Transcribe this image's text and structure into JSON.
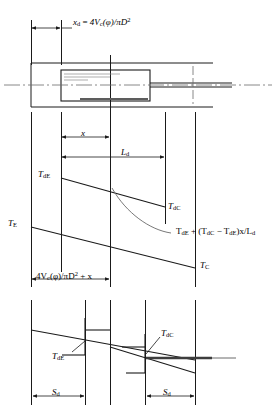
{
  "figure": {
    "type": "engineering-schematic",
    "width": 277,
    "height": 418,
    "line_color": "#1a1a1a",
    "background": "#ffffff"
  },
  "panels": {
    "top": {
      "name": "cylinder-piston-cross-section",
      "dimension_label": {
        "symbol": "x",
        "subscript": "d",
        "equals": "=",
        "expression_prefix": "4V",
        "expression_sub": "c",
        "expression_arg": "(φ)/πD",
        "expression_sup": "2",
        "full_text": "x_d = 4V_c(φ)/πD²"
      }
    },
    "middle": {
      "name": "temperature-profile-panel",
      "dimensions": [
        {
          "id": "x-dimension",
          "label": "x",
          "sub": ""
        },
        {
          "id": "ld-dimension",
          "label": "L",
          "sub": "d"
        }
      ],
      "labels": [
        {
          "id": "t-de-label",
          "base": "T",
          "sub": "dE"
        },
        {
          "id": "t-dc-label",
          "base": "T",
          "sub": "dC"
        },
        {
          "id": "t-e-label",
          "base": "T",
          "sub": "E"
        },
        {
          "id": "t-c-label",
          "base": "T",
          "sub": "C"
        }
      ],
      "equation": {
        "id": "interpolation-equation",
        "full_text": "T_dE + (T_dC − T_dE)x/L_d",
        "parts": {
          "term1_base": "T",
          "term1_sub": "dE",
          "plus": " + (",
          "term2_base": "T",
          "term2_sub": "dC",
          "minus": " − ",
          "term3_base": "T",
          "term3_sub": "dE",
          "tail_open": ")",
          "tail_x": "x",
          "tail_div": "/",
          "tail_L": "L",
          "tail_Lsub": "d"
        }
      },
      "bottom_dimension": {
        "id": "dead-space-plus-x-dimension",
        "prefix": "4V",
        "sub": "c",
        "mid": "(φ)/πD",
        "sup": "2",
        "tail": " + x",
        "full_text": "4V_c(φ)/πD² + x"
      }
    },
    "bottom": {
      "name": "discretized-temperature-step-panel",
      "labels": [
        {
          "id": "t-de-step-label",
          "base": "T",
          "sub": "dE"
        },
        {
          "id": "t-dc-step-label",
          "base": "T",
          "sub": "dC"
        }
      ],
      "dimensions": [
        {
          "id": "sd-left-dimension",
          "base": "S",
          "sub": "d"
        },
        {
          "id": "sd-right-dimension",
          "base": "S",
          "sub": "d"
        }
      ]
    }
  }
}
